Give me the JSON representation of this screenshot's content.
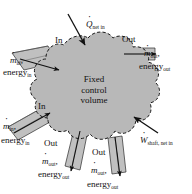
{
  "figure": {
    "background_color": "#ffffff",
    "cloud_fill_color": "#b8b8b8",
    "cloud_stroke_color": "#1a1a1a",
    "pipe_fill_color": "#c0c0c0",
    "pipe_stroke_color": "#2b2b2b",
    "arrow_color": "#111111"
  },
  "center_label": {
    "line1": "Fixed",
    "line2": "control",
    "line3": "volume"
  },
  "heat_input": {
    "symbol": "Q",
    "subscript": "net in",
    "direction": "into control volume",
    "arrow": "down-right"
  },
  "work_input": {
    "symbol": "W",
    "subscript": "shaft, net in",
    "direction": "into control volume",
    "arrow": "up-left"
  },
  "streams": [
    {
      "id": "inlet-upper-left",
      "tag": "In",
      "symbol": "m",
      "symbol_subscript": "in",
      "comma": ",",
      "energy_label": "energy",
      "energy_subscript": "in",
      "direction": "in"
    },
    {
      "id": "inlet-lower-left",
      "tag": "In",
      "symbol": "m",
      "symbol_subscript": "in",
      "comma": ",",
      "energy_label": "energy",
      "energy_subscript": "in",
      "direction": "in"
    },
    {
      "id": "outlet-right",
      "tag": "Out",
      "symbol": "m",
      "symbol_subscript": "out",
      "comma": ",",
      "energy_label": "energy",
      "energy_subscript": "out",
      "direction": "out"
    },
    {
      "id": "outlet-bottom-left",
      "tag": "Out",
      "symbol": "m",
      "symbol_subscript": "out",
      "comma": ",",
      "energy_label": "energy",
      "energy_subscript": "out",
      "direction": "out"
    },
    {
      "id": "outlet-bottom-right",
      "tag": "Out",
      "symbol": "m",
      "symbol_subscript": "out",
      "comma": ",",
      "energy_label": "energy",
      "energy_subscript": "out",
      "direction": "out"
    }
  ]
}
